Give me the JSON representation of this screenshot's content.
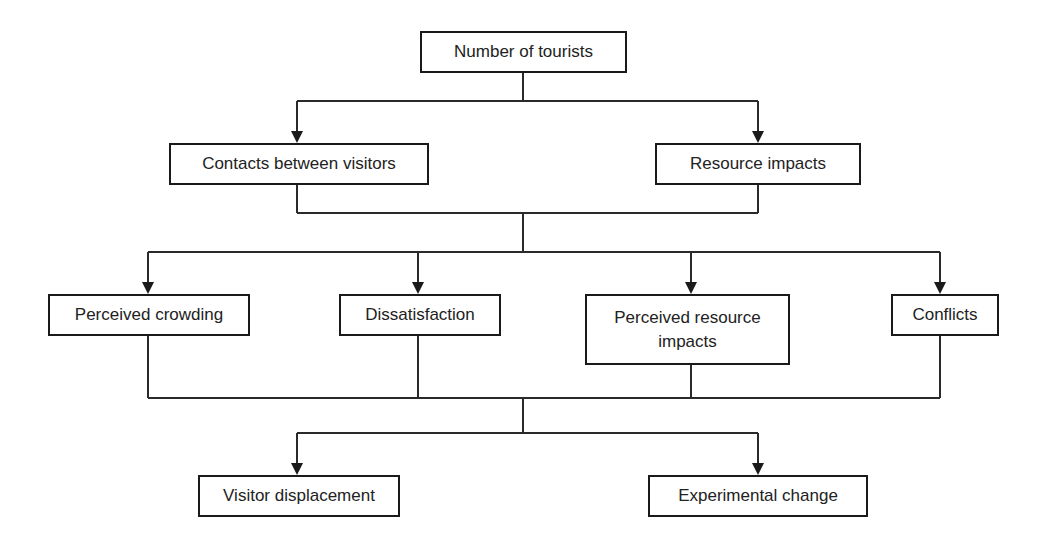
{
  "diagram": {
    "type": "flowchart",
    "nodes": {
      "tourists": {
        "label": "Number of tourists"
      },
      "contacts": {
        "label": "Contacts between visitors"
      },
      "resource_impacts": {
        "label": "Resource impacts"
      },
      "perceived_crowding": {
        "label": "Perceived crowding"
      },
      "dissatisfaction": {
        "label": "Dissatisfaction"
      },
      "perceived_resource_impacts": {
        "label_line1": "Perceived resource",
        "label_line2": "impacts",
        "label": "Perceived resource impacts"
      },
      "conflicts": {
        "label": "Conflicts"
      },
      "visitor_displacement": {
        "label": "Visitor displacement"
      },
      "experimental_change": {
        "label": "Experimental change"
      }
    },
    "edges": [
      {
        "from": "Number of tourists",
        "to": "Contacts between visitors"
      },
      {
        "from": "Number of tourists",
        "to": "Resource impacts"
      },
      {
        "from": [
          "Contacts between visitors",
          "Resource impacts"
        ],
        "to": "Perceived crowding"
      },
      {
        "from": [
          "Contacts between visitors",
          "Resource impacts"
        ],
        "to": "Dissatisfaction"
      },
      {
        "from": [
          "Contacts between visitors",
          "Resource impacts"
        ],
        "to": "Perceived resource impacts"
      },
      {
        "from": [
          "Contacts between visitors",
          "Resource impacts"
        ],
        "to": "Conflicts"
      },
      {
        "from": [
          "Perceived crowding",
          "Dissatisfaction",
          "Perceived resource impacts",
          "Conflicts"
        ],
        "to": "Visitor displacement"
      },
      {
        "from": [
          "Perceived crowding",
          "Dissatisfaction",
          "Perceived resource impacts",
          "Conflicts"
        ],
        "to": "Experimental change"
      }
    ],
    "colors": {
      "line": "#2a2a2a",
      "box_border": "#1a1a1a",
      "background": "#ffffff",
      "text": "#222222"
    }
  }
}
